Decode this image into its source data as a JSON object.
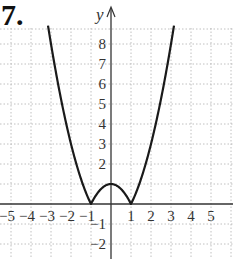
{
  "problem_number": "7.",
  "chart_data": {
    "type": "line",
    "title": "",
    "function": "y = |x^2 - 1|",
    "xlabel": "",
    "ylabel": "y",
    "xlim": [
      -5.5,
      6.1
    ],
    "ylim": [
      -2.8,
      9.3
    ],
    "grid": true,
    "x_ticks": [
      "-5",
      "-4",
      "-3",
      "-2",
      "-1",
      "1",
      "2",
      "3",
      "4",
      "5"
    ],
    "y_ticks": [
      "8",
      "7",
      "6",
      "5",
      "4",
      "3",
      "2",
      "-1",
      "-2"
    ],
    "series": [
      {
        "name": "|x^2-1|",
        "x": [
          -3.15,
          -3,
          -2.5,
          -2,
          -1.5,
          -1,
          -0.5,
          0,
          0.5,
          1,
          1.5,
          2,
          2.5,
          3,
          3.15
        ],
        "values": [
          8.92,
          8,
          5.25,
          3,
          1.25,
          0,
          0.75,
          1,
          0.75,
          0,
          1.25,
          3,
          5.25,
          8,
          8.92
        ]
      }
    ],
    "annotations": [],
    "colors": {
      "curve": "#1a1a1a",
      "grid": "#b0b0b0",
      "axis": "#333333"
    }
  }
}
